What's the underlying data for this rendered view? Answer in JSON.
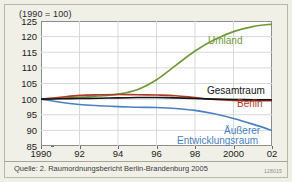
{
  "figure": {
    "index_caption": "(1990 = 100)",
    "source_note": "Quelle: 2. Raumordnungsbericht Berlin-Brandenburg 2005",
    "figure_id": "128015"
  },
  "colors": {
    "umland": "#6f9a3a",
    "gesamtraum": "#141414",
    "berlin": "#b03a2a",
    "aeusserer_entwicklungsraum": "#4a7fc1",
    "background": "#f1f0e8",
    "plot_background": "#ffffff",
    "gridline": "#d9d9d9",
    "axis": "#8d8d8d"
  },
  "labels": {
    "umland": "Umland",
    "gesamtraum": "Gesamtraum",
    "berlin": "Berlin",
    "aeusserer": "Äußerer",
    "entwicklungsraum": "Entwicklungsraum"
  },
  "chart_data": {
    "type": "line",
    "title": "",
    "subtitle": "",
    "xlabel": "",
    "ylabel": "(1990 = 100)",
    "xlim": [
      1990,
      2002
    ],
    "ylim": [
      85,
      125
    ],
    "grid": true,
    "legend_position": "inline-right",
    "y_ticks": [
      85,
      90,
      95,
      100,
      105,
      110,
      115,
      120,
      125
    ],
    "x_ticks": [
      1990,
      1992,
      1994,
      1996,
      1998,
      2000,
      2002
    ],
    "x_tick_labels": [
      "1990",
      "92",
      "94",
      "96",
      "98",
      "2000",
      "02"
    ],
    "x": [
      1990,
      1991,
      1992,
      1993,
      1994,
      1995,
      1996,
      1997,
      1998,
      1999,
      2000,
      2001,
      2002
    ],
    "series": [
      {
        "name": "Umland",
        "color": "#6f9a3a",
        "values": [
          100.0,
          100.3,
          100.6,
          101.0,
          101.6,
          103.0,
          106.2,
          110.8,
          115.4,
          119.0,
          121.6,
          123.2,
          124.0
        ]
      },
      {
        "name": "Gesamtraum",
        "color": "#141414",
        "values": [
          100.0,
          100.1,
          100.2,
          100.3,
          100.4,
          100.5,
          100.5,
          100.4,
          100.2,
          100.0,
          99.9,
          99.8,
          99.8
        ]
      },
      {
        "name": "Berlin",
        "color": "#b03a2a",
        "values": [
          100.0,
          100.6,
          101.2,
          101.4,
          101.5,
          101.4,
          101.3,
          101.1,
          100.5,
          99.9,
          99.6,
          99.5,
          99.5
        ]
      },
      {
        "name": "Äußerer Entwicklungsraum",
        "color": "#4a7fc1",
        "values": [
          100.0,
          99.0,
          98.3,
          97.9,
          97.6,
          97.4,
          97.3,
          97.0,
          96.4,
          95.3,
          93.8,
          92.0,
          90.0
        ]
      }
    ]
  }
}
